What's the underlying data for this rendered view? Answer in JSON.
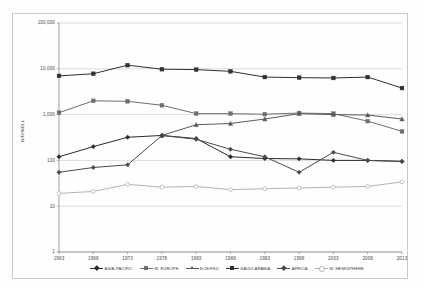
{
  "figure": {
    "ylabel": "B/D/WELL",
    "background_color": "#fdfdfd",
    "frame_color": "#c9c9c9"
  },
  "axes": {
    "y_ticks": [
      "100,000",
      "10,000",
      "1,000",
      "100",
      "10",
      "1"
    ],
    "y_values": [
      100000,
      10000,
      1000,
      100,
      10,
      1
    ],
    "x_ticks": [
      "1963",
      "1968",
      "1973",
      "1978",
      "1983",
      "1988",
      "1993",
      "1998",
      "2003",
      "2008",
      "2013"
    ]
  },
  "legend": {
    "items": [
      {
        "label": "ASIA-PACIFIC",
        "color": "#2b2b2b",
        "marker": "di"
      },
      {
        "label": "W. EUROPE",
        "color": "#6f6f6f",
        "marker": "sq"
      },
      {
        "label": "ECE/FSU",
        "color": "#5a5a5a",
        "marker": "tr"
      },
      {
        "label": "SAUDI ARABIA",
        "color": "#303030",
        "marker": "sq"
      },
      {
        "label": "AFRICA",
        "color": "#4a4a4a",
        "marker": "di"
      },
      {
        "label": "W. HEMISPHERE",
        "color": "#b3b3b3",
        "marker": "ci"
      }
    ]
  },
  "chart_data": {
    "type": "line",
    "title": "",
    "xlabel": "",
    "ylabel": "B/D/WELL",
    "yscale": "log",
    "ylim": [
      1,
      100000
    ],
    "grid": true,
    "legend_position": "bottom",
    "categories": [
      1963,
      1968,
      1973,
      1978,
      1983,
      1988,
      1993,
      1998,
      2003,
      2008,
      2013
    ],
    "series": [
      {
        "name": "SAUDI ARABIA",
        "color": "#303030",
        "marker": "sq",
        "values": [
          7000,
          7800,
          12000,
          9800,
          9600,
          8800,
          6600,
          6400,
          6300,
          6600,
          3800
        ]
      },
      {
        "name": "W. EUROPE",
        "color": "#6f6f6f",
        "marker": "sq",
        "values": [
          1100,
          2000,
          1950,
          1600,
          1050,
          1050,
          1020,
          1080,
          1050,
          720,
          430
        ]
      },
      {
        "name": "ECE/FSU",
        "color": "#5a5a5a",
        "marker": "tr",
        "values": [
          null,
          null,
          null,
          350,
          600,
          640,
          800,
          1050,
          1000,
          980,
          800
        ]
      },
      {
        "name": "ASIA-PACIFIC",
        "color": "#2b2b2b",
        "marker": "di",
        "values": [
          120,
          200,
          320,
          350,
          300,
          120,
          110,
          108,
          100,
          100,
          95
        ]
      },
      {
        "name": "AFRICA",
        "color": "#4a4a4a",
        "marker": "di",
        "values": [
          55,
          70,
          80,
          350,
          290,
          175,
          120,
          55,
          150,
          100,
          95
        ]
      },
      {
        "name": "W. HEMISPHERE",
        "color": "#b3b3b3",
        "marker": "ci",
        "values": [
          19,
          21,
          30,
          26,
          27,
          23,
          24,
          25,
          26,
          27,
          34
        ]
      }
    ]
  }
}
